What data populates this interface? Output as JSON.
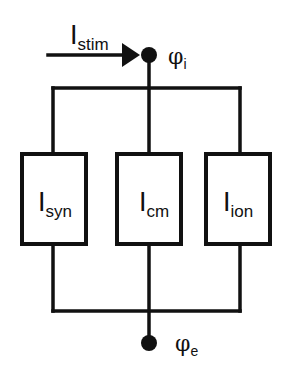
{
  "diagram": {
    "type": "equivalent-circuit",
    "stimulus": {
      "label_main": "I",
      "label_sub": "stim"
    },
    "top_node": {
      "label_main": "φ",
      "label_sub": "i"
    },
    "bottom_node": {
      "label_main": "φ",
      "label_sub": "e"
    },
    "branches": [
      {
        "label_main": "I",
        "label_sub": "syn"
      },
      {
        "label_main": "I",
        "label_sub": "cm"
      },
      {
        "label_main": "I",
        "label_sub": "ion"
      }
    ],
    "colors": {
      "line": "#111111",
      "background": "#ffffff"
    }
  }
}
